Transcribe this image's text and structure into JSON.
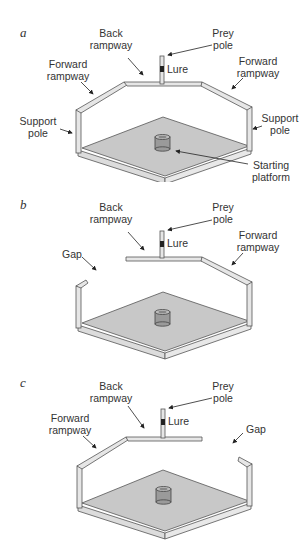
{
  "panels": [
    {
      "letter": "a",
      "labels": {
        "back_rampway": [
          "Back",
          "rampway"
        ],
        "prey_pole": [
          "Prey",
          "pole"
        ],
        "lure": "Lure",
        "forward_rampway_left": [
          "Forward",
          "rampway"
        ],
        "forward_rampway_right": [
          "Forward",
          "rampway"
        ],
        "support_pole_left": [
          "Support",
          "pole"
        ],
        "support_pole_right": [
          "Support",
          "pole"
        ],
        "starting_platform": [
          "Starting",
          "platform"
        ]
      }
    },
    {
      "letter": "b",
      "labels": {
        "back_rampway": [
          "Back",
          "rampway"
        ],
        "prey_pole": [
          "Prey",
          "pole"
        ],
        "lure": "Lure",
        "forward_rampway_right": [
          "Forward",
          "rampway"
        ],
        "gap": "Gap"
      }
    },
    {
      "letter": "c",
      "labels": {
        "back_rampway": [
          "Back",
          "rampway"
        ],
        "prey_pole": [
          "Prey",
          "pole"
        ],
        "lure": "Lure",
        "forward_rampway_left": [
          "Forward",
          "rampway"
        ],
        "gap": "Gap"
      }
    }
  ],
  "colors": {
    "floor": "#c8c8c8",
    "edge": "#555555",
    "rail": "#e6e6e6",
    "cylinder": "#9a9a9a",
    "text": "#333333"
  }
}
